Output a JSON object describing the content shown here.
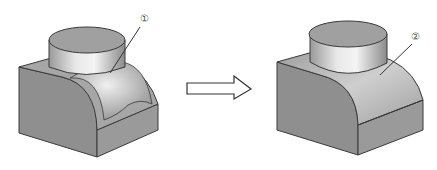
{
  "diagram": {
    "type": "engineering-illustration",
    "left_part": {
      "label": "①",
      "description": "block with quarter-round top and cylinder, with undercut groove"
    },
    "arrow": {
      "direction": "right",
      "style": "hollow"
    },
    "right_part": {
      "label": "②",
      "description": "block with quarter-round top and cylinder, groove removed"
    }
  },
  "colors": {
    "face_front": "#8f8f8f",
    "face_side": "#9a9a9a",
    "face_top": "#a8a8a8",
    "cylinder_top": "#a0a0a0",
    "edge": "#3a3a3a"
  }
}
